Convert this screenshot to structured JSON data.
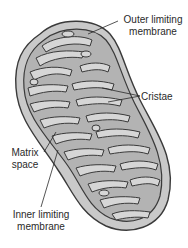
{
  "diagram": {
    "labels": {
      "outer_line1": "Outer limiting",
      "outer_line2": "membrane",
      "cristae": "Cristae",
      "matrix_line1": "Matrix",
      "matrix_line2": "space",
      "inner_line1": "Inner limiting",
      "inner_line2": "membrane"
    },
    "colors": {
      "outer_fill": "#c9c9c9",
      "inner_fill": "#b3b3b3",
      "crista_fill": "#d6d6d6",
      "stroke": "#3a3a3a",
      "text": "#2a2a2a"
    }
  }
}
